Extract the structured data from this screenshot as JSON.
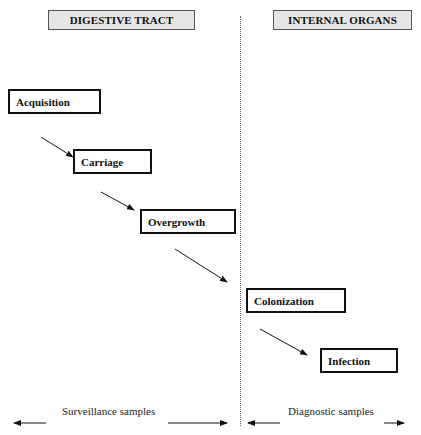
{
  "headers": {
    "left": "DIGESTIVE TRACT",
    "right": "INTERNAL ORGANS"
  },
  "stages": [
    {
      "label": "Acquisition",
      "region": "digestive tract"
    },
    {
      "label": "Carriage",
      "region": "digestive tract"
    },
    {
      "label": "Overgrowth",
      "region": "digestive tract"
    },
    {
      "label": "Colonization",
      "region": "internal organs"
    },
    {
      "label": "Infection",
      "region": "internal organs"
    }
  ],
  "flow": [
    "Acquisition",
    "Carriage",
    "Overgrowth",
    "Colonization",
    "Infection"
  ],
  "footer": {
    "left_caption": "Surveillance samples",
    "right_caption": "Diagnostic samples"
  },
  "icons": {
    "arrow": "arrow-icon",
    "double_arrow": "double-headed-arrow-icon"
  }
}
